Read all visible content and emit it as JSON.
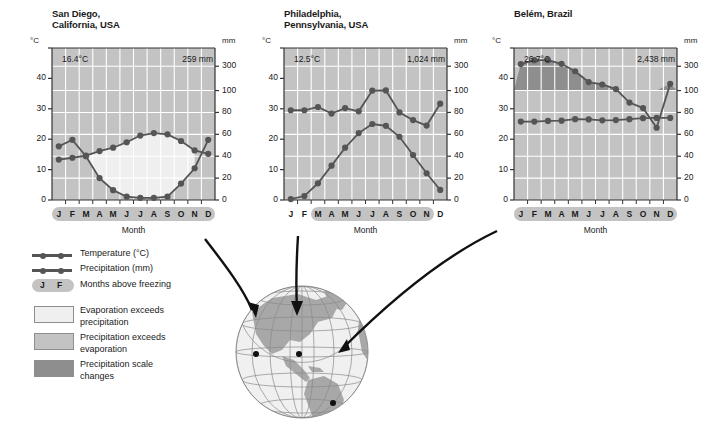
{
  "figure": {
    "axis_label_c": "°C",
    "axis_label_mm": "mm",
    "xtitle": "Month",
    "months": [
      "J",
      "F",
      "M",
      "A",
      "M",
      "J",
      "J",
      "A",
      "S",
      "O",
      "N",
      "D"
    ],
    "temp_ticks": [
      "0",
      "10",
      "20",
      "30",
      "40"
    ],
    "precip_ticks": [
      "0",
      "20",
      "40",
      "60",
      "80",
      "100",
      "300"
    ]
  },
  "legend": {
    "temperature": "Temperature (°C)",
    "precipitation": "Precipitation (mm)",
    "above_freezing": "Months above freezing",
    "above_freezing_months": [
      "J",
      "F"
    ],
    "evap_exceeds": "Evaporation exceeds\nprecipitation",
    "precip_exceeds": "Precipitation exceeds\nevaporation",
    "scale_changes": "Precipitation scale\nchanges"
  },
  "colors": {
    "curve": "#555555",
    "plot_bg": "#c3c3c3",
    "evap_fill": "#efefef",
    "scale_change_fill": "#8e8e8e",
    "gridline": "#ffffff",
    "axis": "#333333",
    "globe_land": "#a8a8a8",
    "globe_ocean": "#f0f0f0"
  },
  "chart_data": [
    {
      "type": "line",
      "title": "San Diego,\nCalifornia, USA",
      "mean_temp_label": "16.4°C",
      "total_precip_label": "259 mm",
      "xlabel": "Month",
      "categories": [
        "J",
        "F",
        "M",
        "A",
        "M",
        "J",
        "J",
        "A",
        "S",
        "O",
        "N",
        "D"
      ],
      "ylabel_left": "°C",
      "ylabel_right": "mm",
      "ylim_left": [
        0,
        50
      ],
      "ylim_right": [
        0,
        300
      ],
      "series": [
        {
          "name": "Temperature (°C)",
          "unit": "°C",
          "values": [
            13.3,
            13.9,
            14.6,
            16.1,
            17.2,
            19.0,
            21.2,
            22.0,
            21.6,
            19.4,
            16.3,
            15.2
          ]
        },
        {
          "name": "Precipitation (mm)",
          "unit": "mm",
          "values": [
            49,
            55,
            40,
            20,
            9,
            3,
            2,
            2,
            3,
            15,
            29,
            55
          ]
        }
      ],
      "months_above_freezing": [
        "J",
        "F",
        "M",
        "A",
        "M",
        "J",
        "J",
        "A",
        "S",
        "O",
        "N",
        "D"
      ],
      "has_scale_change_band": false
    },
    {
      "type": "line",
      "title": "Philadelphia,\nPennsylvania, USA",
      "mean_temp_label": "12.5°C",
      "total_precip_label": "1,024 mm",
      "xlabel": "Month",
      "categories": [
        "J",
        "F",
        "M",
        "A",
        "M",
        "J",
        "J",
        "A",
        "S",
        "O",
        "N",
        "D"
      ],
      "ylabel_left": "°C",
      "ylabel_right": "mm",
      "ylim_left": [
        0,
        50
      ],
      "ylim_right": [
        0,
        300
      ],
      "series": [
        {
          "name": "Temperature (°C)",
          "unit": "°C",
          "values": [
            0.3,
            1.3,
            5.5,
            11.3,
            17.2,
            22.0,
            25.0,
            24.4,
            20.8,
            14.8,
            8.8,
            3.3
          ]
        },
        {
          "name": "Precipitation (mm)",
          "unit": "mm",
          "values": [
            82,
            82,
            85,
            79,
            84,
            81,
            100,
            101,
            80,
            73,
            68,
            88
          ]
        }
      ],
      "months_above_freezing": [
        "M",
        "A",
        "M",
        "J",
        "J",
        "A",
        "S",
        "O",
        "N"
      ],
      "has_scale_change_band": false
    },
    {
      "type": "line",
      "title": "Belém, Brazil",
      "mean_temp_label": "26.7°C",
      "total_precip_label": "2,438 mm",
      "xlabel": "Month",
      "categories": [
        "J",
        "F",
        "M",
        "A",
        "M",
        "J",
        "J",
        "A",
        "S",
        "O",
        "N",
        "D"
      ],
      "ylabel_left": "°C",
      "ylabel_right": "mm",
      "ylim_left": [
        0,
        50
      ],
      "ylim_right": [
        0,
        300
      ],
      "series": [
        {
          "name": "Temperature (°C)",
          "unit": "°C",
          "values": [
            25.8,
            25.8,
            26.0,
            26.1,
            26.6,
            26.5,
            26.2,
            26.3,
            26.6,
            26.9,
            27.0,
            27.0
          ]
        },
        {
          "name": "Precipitation (mm)",
          "unit": "mm",
          "values": [
            318,
            358,
            358,
            320,
            259,
            170,
            150,
            112,
            89,
            84,
            66,
            155,
            310
          ]
        }
      ],
      "months_above_freezing": [
        "J",
        "F",
        "M",
        "A",
        "M",
        "J",
        "J",
        "A",
        "S",
        "O",
        "N",
        "D"
      ],
      "has_scale_change_band": true
    }
  ],
  "globe": {
    "locations": [
      "San Diego",
      "Philadelphia",
      "Belém"
    ]
  }
}
